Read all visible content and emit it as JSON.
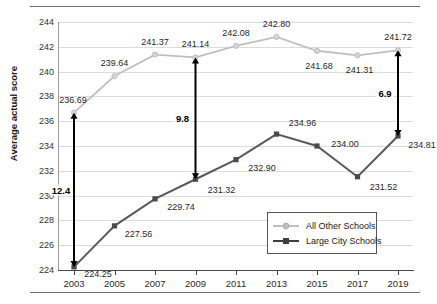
{
  "chart_data": {
    "type": "line",
    "title": "",
    "xlabel": "",
    "ylabel": "Average actual score",
    "categories": [
      "2003",
      "2005",
      "2007",
      "2009",
      "2011",
      "2013",
      "2015",
      "2017",
      "2019"
    ],
    "ylim": [
      224,
      244
    ],
    "ytick_step": 2,
    "yticks": [
      "224",
      "226",
      "228",
      "230",
      "232",
      "234",
      "236",
      "238",
      "240",
      "242",
      "244"
    ],
    "grid": true,
    "legend_position": "inside-bottom-right",
    "series": [
      {
        "name": "All Other Schools",
        "color": "#bfbfbf",
        "marker": "circle",
        "values": [
          236.69,
          239.64,
          241.37,
          241.14,
          242.08,
          242.8,
          241.68,
          241.31,
          241.72
        ],
        "labels": [
          "236.69",
          "239.64",
          "241.37",
          "241.14",
          "242.08",
          "242.80",
          "241.68",
          "241.31",
          "241.72"
        ]
      },
      {
        "name": "Large City Schools",
        "color": "#5a5a5a",
        "marker": "square",
        "values": [
          224.25,
          227.56,
          229.74,
          231.32,
          232.9,
          234.96,
          234.0,
          231.52,
          234.81
        ],
        "labels": [
          "224.25",
          "227.56",
          "229.74",
          "231.32",
          "232.90",
          "234.96",
          "234.00",
          "231.52",
          "234.81"
        ]
      }
    ],
    "annotations": [
      {
        "name": "gap-2003",
        "category": "2003",
        "label": "12.4",
        "from": 224.25,
        "to": 236.69
      },
      {
        "name": "gap-2009",
        "category": "2009",
        "label": "9.8",
        "from": 231.32,
        "to": 241.14
      },
      {
        "name": "gap-2019",
        "category": "2019",
        "label": "6.9",
        "from": 234.81,
        "to": 241.72
      }
    ]
  },
  "legend": {
    "items": [
      {
        "label": "All Other Schools"
      },
      {
        "label": "Large City Schools"
      }
    ]
  },
  "colors": {
    "all_other_schools": "#bfbfbf",
    "large_city_schools": "#5a5a5a",
    "annotation_arrow": "#000000",
    "gridline": "#dcdcdc",
    "rule": "#6f6f6f"
  }
}
